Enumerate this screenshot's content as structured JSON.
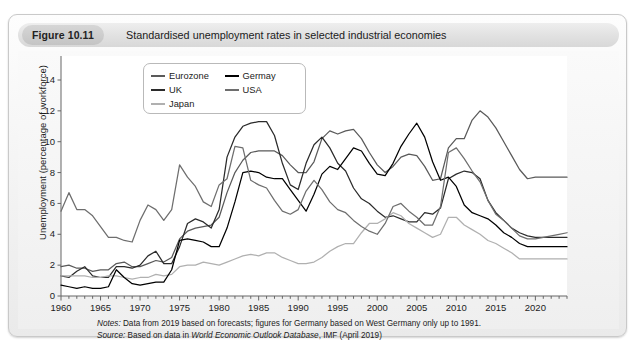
{
  "figure": {
    "tag": "Figure 10.11",
    "caption": "Standardised unemployment rates in selected industrial economies"
  },
  "notes": {
    "notes_lead": "Notes:",
    "notes_text": " Data from 2019 based on forecasts; figures for Germany based on West Germany only up to 1991.",
    "source_lead": "Source:",
    "source_pre": " Based on data in ",
    "source_italic": "World Economic Outlook Database",
    "source_post": ", IMF (April 2019)"
  },
  "legend": {
    "items": [
      {
        "label": "Eurozone",
        "color": "#5a5a5a"
      },
      {
        "label": "UK",
        "color": "#2b2b2b"
      },
      {
        "label": "Japan",
        "color": "#b0b0b0"
      },
      {
        "label": "Germay",
        "color": "#000000"
      },
      {
        "label": "USA",
        "color": "#6e6e6e"
      }
    ]
  },
  "chart_data": {
    "type": "line",
    "title": "Standardised unemployment rates in selected industrial economies",
    "xlabel": "",
    "ylabel": "Unemployment (percentage of workforce)",
    "xlim": [
      1960,
      2024
    ],
    "ylim": [
      0,
      14
    ],
    "yticks": [
      0,
      2,
      4,
      6,
      8,
      10,
      12,
      14
    ],
    "xticks": [
      1960,
      1965,
      1970,
      1975,
      1980,
      1985,
      1990,
      1995,
      2000,
      2005,
      2010,
      2015,
      2020
    ],
    "x_minor_tick_step": 1,
    "grid": false,
    "legend_position": "top-left-inside",
    "x": [
      1960,
      1961,
      1962,
      1963,
      1964,
      1965,
      1966,
      1967,
      1968,
      1969,
      1970,
      1971,
      1972,
      1973,
      1974,
      1975,
      1976,
      1977,
      1978,
      1979,
      1980,
      1981,
      1982,
      1983,
      1984,
      1985,
      1986,
      1987,
      1988,
      1989,
      1990,
      1991,
      1992,
      1993,
      1994,
      1995,
      1996,
      1997,
      1998,
      1999,
      2000,
      2001,
      2002,
      2003,
      2004,
      2005,
      2006,
      2007,
      2008,
      2009,
      2010,
      2011,
      2012,
      2013,
      2014,
      2015,
      2016,
      2017,
      2018,
      2019,
      2020,
      2021,
      2022,
      2023,
      2024
    ],
    "series": [
      {
        "name": "Eurozone",
        "color": "#5a5a5a",
        "values": [
          1.9,
          2.0,
          1.8,
          1.8,
          1.6,
          1.7,
          1.7,
          2.1,
          2.2,
          1.9,
          1.9,
          2.1,
          2.3,
          2.2,
          2.5,
          3.7,
          4.2,
          4.4,
          4.5,
          4.6,
          5.1,
          6.7,
          8.0,
          8.8,
          9.3,
          9.4,
          9.4,
          9.4,
          9.1,
          8.5,
          8.0,
          8.0,
          8.7,
          10.2,
          10.7,
          10.5,
          10.7,
          10.8,
          10.2,
          9.3,
          8.5,
          8.0,
          8.4,
          9.0,
          9.2,
          9.1,
          8.4,
          7.5,
          7.6,
          9.6,
          10.2,
          10.2,
          11.4,
          12.0,
          11.6,
          10.9,
          10.0,
          9.1,
          8.2,
          7.6,
          7.7,
          7.7,
          7.7,
          7.7,
          7.7
        ]
      },
      {
        "name": "UK",
        "color": "#2b2b2b",
        "values": [
          1.3,
          1.2,
          1.6,
          1.9,
          1.3,
          1.2,
          1.2,
          1.9,
          1.9,
          1.8,
          2.0,
          2.6,
          2.9,
          2.1,
          2.1,
          3.2,
          4.7,
          5.0,
          4.8,
          4.4,
          5.6,
          9.0,
          10.3,
          11.0,
          11.2,
          11.3,
          11.3,
          10.4,
          8.6,
          7.2,
          6.9,
          8.6,
          9.8,
          10.3,
          9.6,
          8.6,
          8.1,
          7.0,
          6.3,
          6.0,
          5.5,
          5.1,
          5.2,
          5.0,
          4.8,
          4.8,
          5.4,
          5.3,
          5.7,
          7.6,
          7.9,
          8.1,
          8.0,
          7.6,
          6.2,
          5.4,
          4.9,
          4.4,
          4.1,
          3.9,
          3.8,
          3.8,
          3.8,
          3.8,
          3.8
        ]
      },
      {
        "name": "Japan",
        "color": "#b0b0b0",
        "values": [
          1.3,
          1.3,
          1.3,
          1.3,
          1.2,
          1.2,
          1.3,
          1.3,
          1.2,
          1.1,
          1.2,
          1.2,
          1.4,
          1.3,
          1.4,
          1.9,
          2.0,
          2.0,
          2.2,
          2.1,
          2.0,
          2.2,
          2.4,
          2.6,
          2.7,
          2.6,
          2.8,
          2.8,
          2.5,
          2.3,
          2.1,
          2.1,
          2.2,
          2.5,
          2.9,
          3.2,
          3.4,
          3.4,
          4.1,
          4.7,
          4.7,
          5.0,
          5.4,
          5.2,
          4.7,
          4.4,
          4.1,
          3.8,
          4.0,
          5.1,
          5.1,
          4.6,
          4.3,
          4.0,
          3.6,
          3.4,
          3.1,
          2.8,
          2.4,
          2.4,
          2.4,
          2.4,
          2.4,
          2.4,
          2.4
        ]
      },
      {
        "name": "Germay",
        "color": "#000000",
        "values": [
          0.7,
          0.6,
          0.5,
          0.6,
          0.5,
          0.5,
          0.6,
          1.7,
          1.2,
          0.8,
          0.7,
          0.8,
          0.9,
          0.9,
          1.7,
          3.6,
          3.7,
          3.6,
          3.5,
          3.2,
          3.2,
          4.4,
          6.1,
          8.0,
          8.1,
          8.0,
          7.7,
          7.6,
          7.6,
          6.9,
          6.2,
          5.5,
          6.6,
          7.9,
          8.4,
          8.2,
          8.9,
          9.6,
          9.4,
          8.6,
          7.9,
          7.8,
          8.6,
          9.7,
          10.5,
          11.2,
          10.3,
          8.7,
          7.5,
          7.7,
          7.1,
          5.9,
          5.4,
          5.2,
          5.0,
          4.6,
          4.1,
          3.8,
          3.4,
          3.2,
          3.2,
          3.2,
          3.2,
          3.2,
          3.2
        ]
      },
      {
        "name": "USA",
        "color": "#6e6e6e",
        "values": [
          5.5,
          6.7,
          5.6,
          5.6,
          5.2,
          4.5,
          3.8,
          3.8,
          3.6,
          3.5,
          4.9,
          5.9,
          5.6,
          4.9,
          5.6,
          8.5,
          7.7,
          7.1,
          6.1,
          5.8,
          7.2,
          7.6,
          9.7,
          9.6,
          7.5,
          7.2,
          7.0,
          6.2,
          5.5,
          5.3,
          5.6,
          6.8,
          7.5,
          6.9,
          6.1,
          5.6,
          5.4,
          4.9,
          4.5,
          4.2,
          4.0,
          4.7,
          5.8,
          6.0,
          5.5,
          5.1,
          4.6,
          4.6,
          5.8,
          9.3,
          9.6,
          8.9,
          8.1,
          7.4,
          6.2,
          5.3,
          4.9,
          4.4,
          3.9,
          3.7,
          3.7,
          3.8,
          3.9,
          4.0,
          4.1
        ]
      }
    ]
  }
}
